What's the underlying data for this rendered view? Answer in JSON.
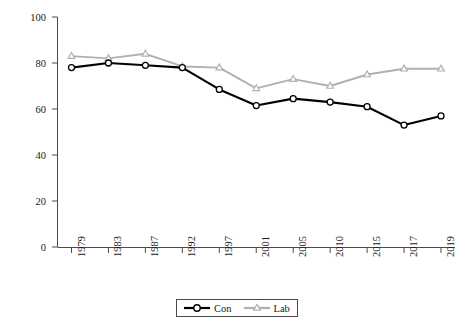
{
  "chart_data": {
    "type": "line",
    "title": "",
    "subtitle": "",
    "xlabel": "",
    "ylabel": "As a proportion of party's vote (%)",
    "categories": [
      "1979",
      "1983",
      "1987",
      "1992",
      "1997",
      "2001",
      "2005",
      "2010",
      "2015",
      "2017",
      "2019"
    ],
    "ylim": [
      0,
      100
    ],
    "yticks": [
      "0",
      "20",
      "40",
      "60",
      "80",
      "100"
    ],
    "ytick_values": [
      0,
      20,
      40,
      60,
      80,
      100
    ],
    "grid": false,
    "legend_position": "bottom-center",
    "series": [
      {
        "name": "Con",
        "color": "#000000",
        "marker": "circle",
        "values": [
          78,
          80,
          79,
          78,
          68.5,
          61.5,
          64.5,
          63,
          61,
          53,
          57
        ]
      },
      {
        "name": "Lab",
        "color": "#b0b0b0",
        "marker": "triangle",
        "values": [
          83,
          82,
          84,
          78.5,
          78,
          69,
          73,
          70,
          75,
          77.5,
          77.5
        ]
      }
    ]
  },
  "legend": {
    "items": [
      {
        "label": "Con"
      },
      {
        "label": "Lab"
      }
    ]
  },
  "colors": {
    "con": "#000000",
    "lab": "#b0b0b0",
    "axis": "#4a4a4a",
    "text": "#1a1a1a",
    "background": "#ffffff"
  }
}
